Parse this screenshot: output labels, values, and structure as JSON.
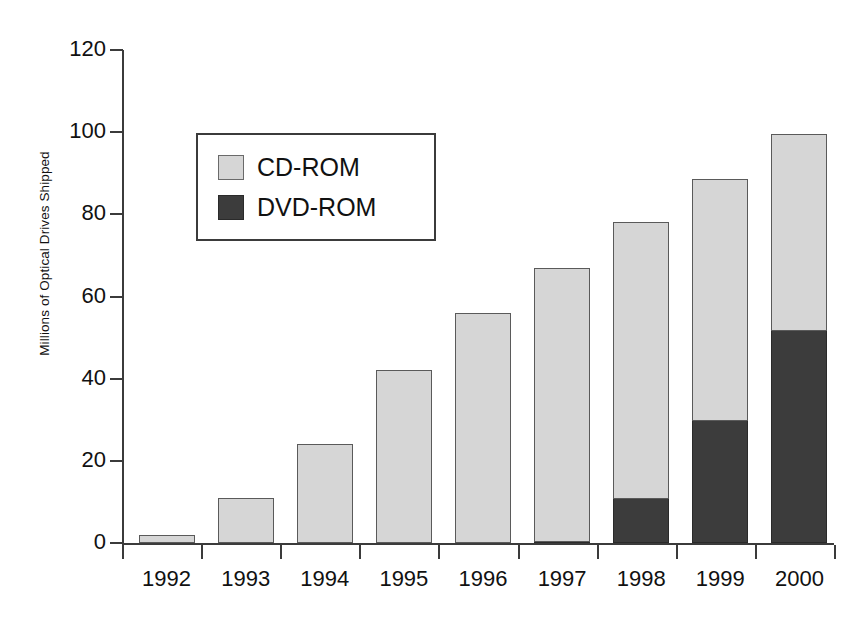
{
  "chart_data": {
    "type": "bar",
    "subtype": "stacked-vertical",
    "title": "",
    "xlabel": "",
    "ylabel": "Millions of Optical Drives Shipped",
    "categories": [
      "1992",
      "1993",
      "1994",
      "1995",
      "1996",
      "1997",
      "1998",
      "1999",
      "2000"
    ],
    "series": [
      {
        "name": "DVD-ROM",
        "color": "#3c3c3c",
        "values": [
          0,
          0,
          0,
          0,
          0,
          0.5,
          11,
          30,
          52
        ]
      },
      {
        "name": "CD-ROM",
        "color": "#d6d6d6",
        "values": [
          2,
          11,
          24,
          42,
          56,
          66.5,
          67.5,
          59,
          48
        ]
      }
    ],
    "totals": [
      2,
      11,
      24,
      42,
      56,
      67,
      78.5,
      89,
      100
    ],
    "ylim": [
      0,
      120
    ],
    "yticks": [
      0,
      20,
      40,
      60,
      80,
      100,
      120
    ],
    "ytick_labels": [
      "0",
      "20",
      "40",
      "60",
      "80",
      "100",
      "120"
    ],
    "grid": false,
    "legend_position": "upper-left-inside",
    "axis_color": "#3b3b3b"
  },
  "legend": {
    "items": [
      {
        "label": "CD-ROM",
        "swatch": "light-gray"
      },
      {
        "label": "DVD-ROM",
        "swatch": "dark-gray"
      }
    ]
  }
}
